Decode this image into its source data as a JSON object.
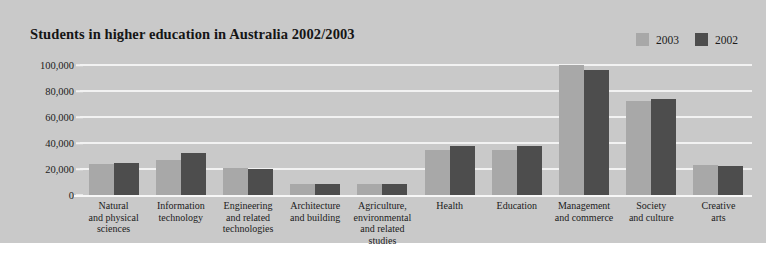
{
  "chart_data": {
    "type": "bar",
    "title": "Students in higher education in Australia 2002/2003",
    "xlabel": "",
    "ylabel": "",
    "ylim": [
      0,
      100000
    ],
    "yticks": [
      0,
      20000,
      40000,
      60000,
      80000,
      100000
    ],
    "ytick_labels": [
      "0",
      "20,000",
      "40,000",
      "60,000",
      "80,000",
      "100,000"
    ],
    "grid": true,
    "legend_position": "top-right",
    "categories": [
      "Natural and physical sciences",
      "Information technology",
      "Engineering and related technologies",
      "Architecture and building",
      "Agriculture, environmental and related studies",
      "Health",
      "Education",
      "Management and commerce",
      "Society and culture",
      "Creative arts"
    ],
    "category_lines": [
      [
        "Natural",
        "and physical",
        "sciences"
      ],
      [
        "Information",
        "technology"
      ],
      [
        "Engineering",
        "and related",
        "technologies"
      ],
      [
        "Architecture",
        "and building"
      ],
      [
        "Agriculture,",
        "environmental",
        "and related",
        "studies"
      ],
      [
        "Health"
      ],
      [
        "Education"
      ],
      [
        "Management",
        "and commerce"
      ],
      [
        "Society",
        "and culture"
      ],
      [
        "Creative",
        "arts"
      ]
    ],
    "series": [
      {
        "name": "2003",
        "color": "#a8a8a8",
        "values": [
          24000,
          27000,
          21000,
          8500,
          8500,
          35000,
          35000,
          100000,
          72000,
          23000
        ]
      },
      {
        "name": "2002",
        "color": "#4d4d4d",
        "values": [
          24500,
          32000,
          20000,
          8500,
          8500,
          38000,
          38000,
          96000,
          74000,
          22500
        ]
      }
    ]
  },
  "colors": {
    "panel_background": "#c9c9c9",
    "page_background": "#ffffff",
    "gridline": "#f2f2f2",
    "baseline": "#f7f7f7",
    "text": "#1c1c1c",
    "title": "#151515",
    "series_2003": "#a8a8a8",
    "series_2002": "#4d4d4d"
  }
}
